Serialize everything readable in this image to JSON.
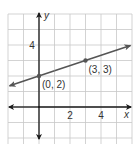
{
  "chart_data": {
    "type": "line",
    "title": "",
    "xlabel": "x",
    "ylabel": "y",
    "xlim": [
      -2,
      6
    ],
    "ylim": [
      -2,
      6
    ],
    "grid": true,
    "x_ticks": [
      {
        "value": 2,
        "label": "2"
      },
      {
        "value": 4,
        "label": "4"
      }
    ],
    "y_ticks": [
      {
        "value": 4,
        "label": "4"
      }
    ],
    "series": [
      {
        "name": "line",
        "equation": "y = (1/3)x + 2",
        "arrows_both_ends": true,
        "x": [
          0,
          3
        ],
        "y": [
          2,
          3
        ]
      }
    ],
    "points": [
      {
        "x": 0,
        "y": 2,
        "label": "(0, 2)"
      },
      {
        "x": 3,
        "y": 3,
        "label": "(3, 3)"
      }
    ],
    "colors": {
      "grid": "#c8c8c8",
      "axes": "#1a1a1a",
      "line": "#555555",
      "text": "#333333"
    }
  }
}
